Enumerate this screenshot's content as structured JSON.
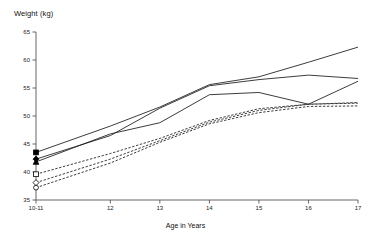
{
  "chart_data": {
    "type": "line",
    "title": "",
    "ylabel": "Weight (kg)",
    "xlabel": "Age in Years",
    "xlim": [
      10.5,
      17
    ],
    "ylim": [
      35,
      65
    ],
    "yticks": [
      35,
      40,
      45,
      50,
      55,
      60,
      65
    ],
    "xticks": [
      10.5,
      12,
      13,
      14,
      15,
      16,
      17
    ],
    "xtick_labels": [
      "10-11",
      "12",
      "13",
      "14",
      "15",
      "16",
      "17"
    ],
    "grid": false,
    "legend": "none",
    "x": [
      10.5,
      12,
      13,
      14,
      15,
      16,
      17
    ],
    "series": [
      {
        "name": "Solid series 1",
        "style": "solid",
        "marker": "filled-square",
        "values": [
          43.5,
          48.2,
          51.6,
          55.6,
          57.0,
          59.6,
          62.3
        ]
      },
      {
        "name": "Solid series 2",
        "style": "solid",
        "marker": "filled-diamond",
        "values": [
          42.3,
          46.5,
          51.4,
          55.4,
          56.5,
          57.3,
          56.7
        ]
      },
      {
        "name": "Solid series 3",
        "style": "solid",
        "marker": "filled-triangle",
        "values": [
          41.8,
          46.8,
          48.8,
          53.8,
          54.2,
          52.1,
          56.2
        ]
      },
      {
        "name": "Dashed series 1",
        "style": "dashed",
        "marker": "open-square",
        "values": [
          39.6,
          43.3,
          46.0,
          49.2,
          51.3,
          52.1,
          52.4
        ]
      },
      {
        "name": "Dashed series 2",
        "style": "dashed",
        "marker": "open-diamond",
        "values": [
          38.1,
          42.3,
          45.6,
          48.9,
          51.0,
          52.1,
          52.3
        ]
      },
      {
        "name": "Dashed series 3",
        "style": "dashed",
        "marker": "open-circle",
        "values": [
          37.2,
          41.6,
          45.3,
          48.6,
          50.6,
          51.7,
          51.8
        ]
      }
    ]
  }
}
